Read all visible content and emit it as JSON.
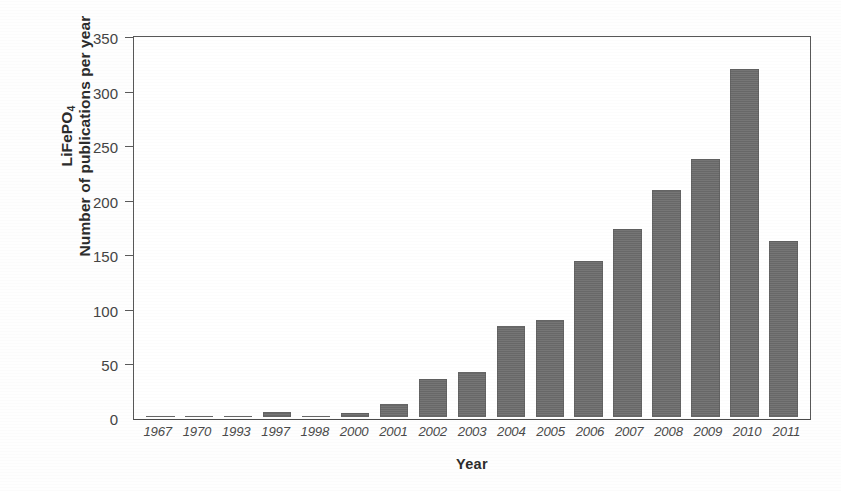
{
  "chart_data": {
    "type": "bar",
    "title": "",
    "xlabel": "Year",
    "ylabel_lines": [
      "LiFePO4",
      "Number of publications per year"
    ],
    "ylabel_formula_prefix": "LiFePO",
    "ylabel_formula_subscript": "4",
    "ylabel_secondary": "Number of publications per year",
    "categories": [
      "1967",
      "1970",
      "1993",
      "1997",
      "1998",
      "2000",
      "2001",
      "2002",
      "2003",
      "2004",
      "2005",
      "2006",
      "2007",
      "2008",
      "2009",
      "2010",
      "2011"
    ],
    "values": [
      1,
      1,
      1,
      5,
      1,
      4,
      12,
      35,
      42,
      84,
      89,
      143,
      173,
      208,
      237,
      319,
      162
    ],
    "ylim": [
      0,
      350
    ],
    "ytick_labels": [
      "350",
      "300",
      "250",
      "200",
      "150",
      "100",
      "50",
      "0"
    ],
    "ytick_values": [
      350,
      300,
      250,
      200,
      150,
      100,
      50,
      0
    ],
    "grid": false,
    "legend": false,
    "bar_color": "#6e6e6e",
    "axis_color": "#585858",
    "background": "#ffffff"
  },
  "axes": {
    "x_axis_title": "Year"
  }
}
